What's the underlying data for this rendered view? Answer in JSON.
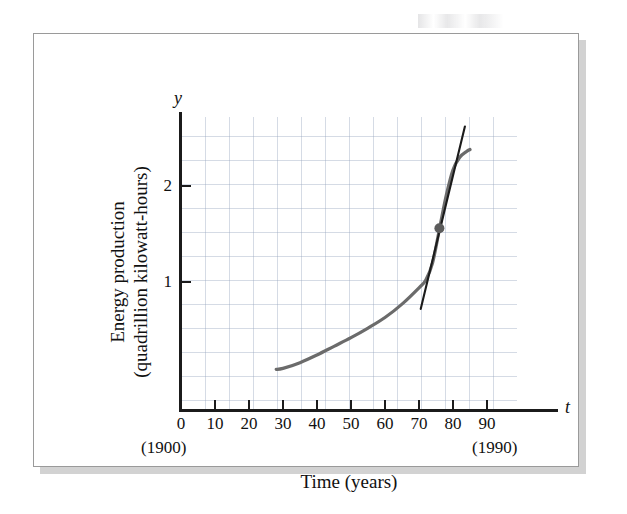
{
  "figure": {
    "kind": "textbook-figure-plate",
    "frame_color": "#9a9a9a",
    "background": "#ffffff"
  },
  "chart_data": {
    "type": "line",
    "title": "",
    "subtitle": "",
    "xlabel": "Time (years)",
    "ylabel": "Energy production (quadrillion kilowatt-hours)",
    "ylabel_line1": "Energy production",
    "ylabel_line2": "(quadrillion kilowatt-hours)",
    "x_axis_symbol": "t",
    "y_axis_symbol": "y",
    "grid": true,
    "grid_color": "#96a5be",
    "legend": "none",
    "xlim": [
      0,
      100
    ],
    "ylim": [
      0,
      2.85
    ],
    "xticks": [
      0,
      10,
      20,
      30,
      40,
      50,
      60,
      70,
      80,
      90
    ],
    "xtick_labels": [
      "0",
      "10",
      "20",
      "30",
      "40",
      "50",
      "60",
      "70",
      "80",
      "90"
    ],
    "yticks": [
      1,
      2
    ],
    "ytick_labels": [
      "1",
      "2"
    ],
    "x_annotation_left": "(1900)",
    "x_annotation_right": "(1990)",
    "series": [
      {
        "name": "Energy production",
        "color": "#6b6b6b",
        "x": [
          28,
          30,
          35,
          40,
          45,
          50,
          55,
          60,
          65,
          70,
          72,
          74,
          76,
          78,
          80,
          82,
          84,
          85
        ],
        "y": [
          0.09,
          0.1,
          0.16,
          0.24,
          0.33,
          0.42,
          0.52,
          0.63,
          0.77,
          0.94,
          1.02,
          1.2,
          1.55,
          1.9,
          2.17,
          2.3,
          2.36,
          2.38
        ]
      },
      {
        "name": "Tangent line at t = 76",
        "color": "#1b1b1b",
        "x": [
          70.5,
          83.5
        ],
        "y": [
          0.72,
          2.62
        ]
      }
    ],
    "points": [
      {
        "name": "tangency-point",
        "x": 76,
        "y": 1.56,
        "color": "#5c5c5c",
        "radius": 5
      }
    ]
  }
}
